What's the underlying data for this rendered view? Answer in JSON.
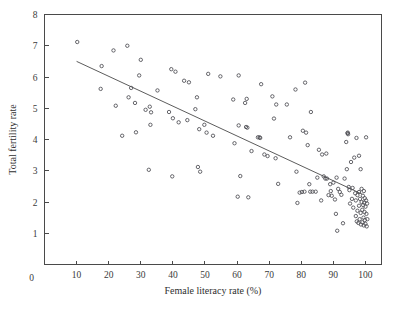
{
  "chart_data": {
    "type": "scatter",
    "title": "",
    "xlabel": "Female literacy rate (%)",
    "ylabel": "Total fertility rate",
    "xlim": [
      0,
      105
    ],
    "ylim": [
      0,
      8
    ],
    "xticks": [
      10,
      20,
      30,
      40,
      50,
      60,
      70,
      80,
      90,
      100
    ],
    "xtick_labels": [
      "10",
      "20",
      "30",
      "40",
      "50",
      "60",
      "70",
      "80",
      "90",
      "100"
    ],
    "yticks": [
      1,
      2,
      3,
      4,
      5,
      6,
      7,
      8
    ],
    "ytick_labels": [
      "1",
      "2",
      "3",
      "4",
      "5",
      "6",
      "7",
      "8"
    ],
    "origin_label": "0",
    "grid": false,
    "legend": "none",
    "marker": "open-circle",
    "marker_color": "#4b4b52",
    "line_color": "#4a4a4a",
    "trendline": {
      "label": "linear fit",
      "x_start": 10,
      "y_start": 6.5,
      "x_end": 99,
      "y_end": 2.25
    },
    "points": [
      [
        10.2,
        7.12
      ],
      [
        17.8,
        6.35
      ],
      [
        17.5,
        5.62
      ],
      [
        21.5,
        6.85
      ],
      [
        22.2,
        5.08
      ],
      [
        24.2,
        4.12
      ],
      [
        25.8,
        7.0
      ],
      [
        26.2,
        5.35
      ],
      [
        27.0,
        5.65
      ],
      [
        28.2,
        5.17
      ],
      [
        28.5,
        4.23
      ],
      [
        29.5,
        6.05
      ],
      [
        30.0,
        6.55
      ],
      [
        31.5,
        4.95
      ],
      [
        32.5,
        3.03
      ],
      [
        32.8,
        5.05
      ],
      [
        33.2,
        4.87
      ],
      [
        33.0,
        4.47
      ],
      [
        35.2,
        5.57
      ],
      [
        38.8,
        4.88
      ],
      [
        39.5,
        6.25
      ],
      [
        39.8,
        2.82
      ],
      [
        40.0,
        4.68
      ],
      [
        40.8,
        6.17
      ],
      [
        41.8,
        4.55
      ],
      [
        43.5,
        5.88
      ],
      [
        44.5,
        4.62
      ],
      [
        45.0,
        5.83
      ],
      [
        47.0,
        4.97
      ],
      [
        47.5,
        5.35
      ],
      [
        47.8,
        3.12
      ],
      [
        48.2,
        4.33
      ],
      [
        48.5,
        2.97
      ],
      [
        49.8,
        4.47
      ],
      [
        50.5,
        4.22
      ],
      [
        51.0,
        6.1
      ],
      [
        52.5,
        4.12
      ],
      [
        54.8,
        6.02
      ],
      [
        58.8,
        5.28
      ],
      [
        59.2,
        3.88
      ],
      [
        60.2,
        2.17
      ],
      [
        60.5,
        4.45
      ],
      [
        60.5,
        6.05
      ],
      [
        61.0,
        2.83
      ],
      [
        62.5,
        5.17
      ],
      [
        62.8,
        4.4
      ],
      [
        63.0,
        5.3
      ],
      [
        63.2,
        4.38
      ],
      [
        63.5,
        2.15
      ],
      [
        64.5,
        3.63
      ],
      [
        66.5,
        4.07
      ],
      [
        67.0,
        4.07
      ],
      [
        67.5,
        5.77
      ],
      [
        68.5,
        3.52
      ],
      [
        69.5,
        3.47
      ],
      [
        71.0,
        5.38
      ],
      [
        71.5,
        4.67
      ],
      [
        72.0,
        3.4
      ],
      [
        72.2,
        5.12
      ],
      [
        72.8,
        2.58
      ],
      [
        75.5,
        5.12
      ],
      [
        76.5,
        4.07
      ],
      [
        78.2,
        5.6
      ],
      [
        78.5,
        2.97
      ],
      [
        78.8,
        1.97
      ],
      [
        79.5,
        2.3
      ],
      [
        80.2,
        2.32
      ],
      [
        80.5,
        4.28
      ],
      [
        81.0,
        2.33
      ],
      [
        81.2,
        5.82
      ],
      [
        81.5,
        4.22
      ],
      [
        82.0,
        3.82
      ],
      [
        82.5,
        2.57
      ],
      [
        82.8,
        2.33
      ],
      [
        83.0,
        4.88
      ],
      [
        83.5,
        2.33
      ],
      [
        84.5,
        2.33
      ],
      [
        85.5,
        3.67
      ],
      [
        86.2,
        2.05
      ],
      [
        86.5,
        3.52
      ],
      [
        87.0,
        2.82
      ],
      [
        87.5,
        2.75
      ],
      [
        87.8,
        3.55
      ],
      [
        88.0,
        2.75
      ],
      [
        88.5,
        2.22
      ],
      [
        89.0,
        2.57
      ],
      [
        89.5,
        2.2
      ],
      [
        90.0,
        2.62
      ],
      [
        90.5,
        2.08
      ],
      [
        90.8,
        1.62
      ],
      [
        91.0,
        2.78
      ],
      [
        91.2,
        1.08
      ],
      [
        91.5,
        2.42
      ],
      [
        92.0,
        2.32
      ],
      [
        92.5,
        2.23
      ],
      [
        93.0,
        1.32
      ],
      [
        93.5,
        2.75
      ],
      [
        94.0,
        3.92
      ],
      [
        94.2,
        3.05
      ],
      [
        94.5,
        4.22
      ],
      [
        94.6,
        4.17
      ],
      [
        94.8,
        2.48
      ],
      [
        95.0,
        2.38
      ],
      [
        95.2,
        1.95
      ],
      [
        95.5,
        3.28
      ],
      [
        95.8,
        2.1
      ],
      [
        96.0,
        2.45
      ],
      [
        96.2,
        1.82
      ],
      [
        96.5,
        3.42
      ],
      [
        96.8,
        2.28
      ],
      [
        97.0,
        1.55
      ],
      [
        97.0,
        2.05
      ],
      [
        97.2,
        4.05
      ],
      [
        97.3,
        1.38
      ],
      [
        97.5,
        2.22
      ],
      [
        97.5,
        1.72
      ],
      [
        97.8,
        1.33
      ],
      [
        98.0,
        3.48
      ],
      [
        98.0,
        2.32
      ],
      [
        98.0,
        1.88
      ],
      [
        98.2,
        1.45
      ],
      [
        98.3,
        2.1
      ],
      [
        98.5,
        3.05
      ],
      [
        98.5,
        1.65
      ],
      [
        98.6,
        1.28
      ],
      [
        98.8,
        2.42
      ],
      [
        98.8,
        2.0
      ],
      [
        99.0,
        1.75
      ],
      [
        99.0,
        1.35
      ],
      [
        99.2,
        2.2
      ],
      [
        99.3,
        1.9
      ],
      [
        99.4,
        1.5
      ],
      [
        99.5,
        2.35
      ],
      [
        99.5,
        1.25
      ],
      [
        99.6,
        1.98
      ],
      [
        99.7,
        1.68
      ],
      [
        99.8,
        2.12
      ],
      [
        99.8,
        1.42
      ],
      [
        100.0,
        1.85
      ],
      [
        100.0,
        1.3
      ],
      [
        100.2,
        4.07
      ],
      [
        100.2,
        2.05
      ],
      [
        100.3,
        1.62
      ],
      [
        100.4,
        1.22
      ],
      [
        100.5,
        1.95
      ],
      [
        100.6,
        1.45
      ],
      [
        67.2,
        4.05
      ],
      [
        94.4,
        4.2
      ],
      [
        89.2,
        2.35
      ],
      [
        85.0,
        2.78
      ]
    ]
  }
}
